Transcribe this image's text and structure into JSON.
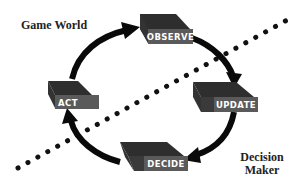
{
  "diagram": {
    "type": "cycle",
    "labels": {
      "game_world": "Game World",
      "decision_maker_line1": "Decision",
      "decision_maker_line2": "Maker"
    },
    "nodes": [
      {
        "id": "observe",
        "label": "OBSERVE"
      },
      {
        "id": "update",
        "label": "UPDATE"
      },
      {
        "id": "decide",
        "label": "DECIDE"
      },
      {
        "id": "act",
        "label": "ACT"
      }
    ],
    "edges": [
      {
        "from": "observe",
        "to": "update"
      },
      {
        "from": "update",
        "to": "decide"
      },
      {
        "from": "decide",
        "to": "act"
      },
      {
        "from": "act",
        "to": "observe"
      }
    ],
    "divider": {
      "style": "dotted",
      "separates": [
        "Game World",
        "Decision Maker"
      ]
    },
    "colors": {
      "box_top": "#2e2e2e",
      "box_side": "#3a3a3a",
      "box_front": "#5a5a5a",
      "arrow": "#0a0a0a",
      "dots": "#111111",
      "text": "#222222"
    }
  }
}
